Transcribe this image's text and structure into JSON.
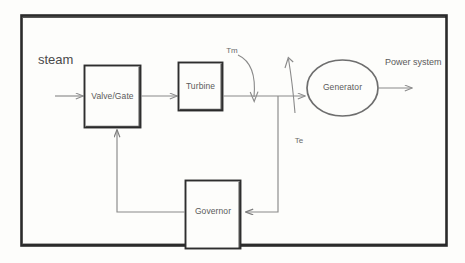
{
  "diagram": {
    "frame": {
      "name": "outer-border"
    },
    "colors": {
      "background": "#fdfdfb",
      "frame_stroke": "#2b2b2b",
      "block_stroke": "#2e2e2e",
      "line_stroke": "#8a8a8a",
      "text": "#5a5a5a"
    },
    "blocks": [
      {
        "id": "valve",
        "label": "Valve/Gate",
        "shape": "rectangle"
      },
      {
        "id": "turbine",
        "label": "Turbine",
        "shape": "rectangle"
      },
      {
        "id": "generator",
        "label": "Generator",
        "shape": "ellipse"
      },
      {
        "id": "governor",
        "label": "Governor",
        "shape": "rectangle"
      }
    ],
    "labels": {
      "input": "steam",
      "mechanical_torque": "Tm",
      "electrical_torque": "Te",
      "output": "Power system"
    },
    "connections": [
      {
        "id": "steam-to-valve",
        "from": "steam",
        "to": "valve"
      },
      {
        "id": "valve-to-turbine",
        "from": "valve",
        "to": "turbine"
      },
      {
        "id": "turbine-to-generator",
        "from": "turbine",
        "to": "generator"
      },
      {
        "id": "generator-to-output",
        "from": "generator",
        "to": "Power system"
      },
      {
        "id": "feedback-to-governor",
        "from": "generator-line",
        "to": "governor"
      },
      {
        "id": "governor-to-valve",
        "from": "governor",
        "to": "valve"
      }
    ]
  }
}
